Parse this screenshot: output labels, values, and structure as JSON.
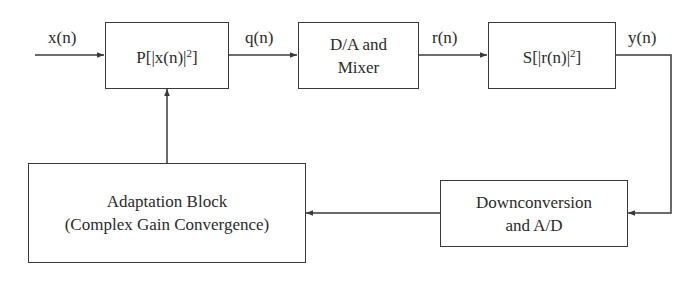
{
  "diagram": {
    "type": "block-diagram",
    "signals": {
      "input": "x(n)",
      "p_out": "q(n)",
      "da_out": "r(n)",
      "output": "y(n)"
    },
    "blocks": {
      "predistorter": {
        "prefix": "P[|x(n)|",
        "exp": "2",
        "suffix": "]"
      },
      "da_mixer": {
        "line1": "D/A and",
        "line2": "Mixer"
      },
      "amplifier": {
        "prefix": "S[|r(n)|",
        "exp": "2",
        "suffix": "]"
      },
      "adaptation": {
        "line1": "Adaptation Block",
        "line2": "(Complex Gain Convergence)"
      },
      "downconversion": {
        "line1": "Downconversion",
        "line2": "and A/D"
      }
    },
    "edges": [
      {
        "from": "input",
        "to": "predistorter",
        "label": "x(n)"
      },
      {
        "from": "predistorter",
        "to": "da_mixer",
        "label": "q(n)"
      },
      {
        "from": "da_mixer",
        "to": "amplifier",
        "label": "r(n)"
      },
      {
        "from": "amplifier",
        "to": "downconversion",
        "label": "y(n)"
      },
      {
        "from": "downconversion",
        "to": "adaptation",
        "label": ""
      },
      {
        "from": "adaptation",
        "to": "predistorter",
        "label": ""
      }
    ],
    "colors": {
      "line": "#3a3a3a",
      "text": "#2b2b2b",
      "background": "#ffffff"
    }
  }
}
